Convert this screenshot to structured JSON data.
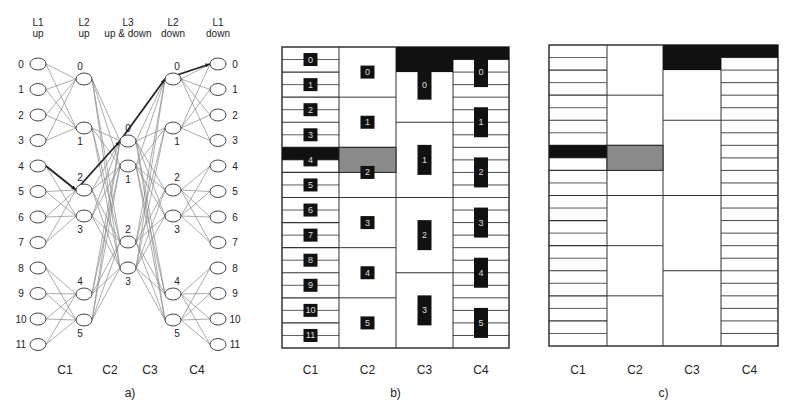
{
  "figure": {
    "panels": [
      {
        "id": "a",
        "caption": "a)"
      },
      {
        "id": "b",
        "caption": "b)"
      },
      {
        "id": "c",
        "caption": "c)"
      }
    ],
    "column_labels": [
      "C1",
      "C2",
      "C3",
      "C4"
    ]
  },
  "panel_a": {
    "caption": "a)",
    "stage_headers": [
      {
        "line1": "L1",
        "line2": "up"
      },
      {
        "line1": "L2",
        "line2": "up"
      },
      {
        "line1": "L3",
        "line2": "up & down"
      },
      {
        "line1": "L2",
        "line2": "down"
      },
      {
        "line1": "L1",
        "line2": "down"
      }
    ],
    "l1_up_nodes": [
      "0",
      "1",
      "2",
      "3",
      "4",
      "5",
      "6",
      "7",
      "8",
      "9",
      "10",
      "11"
    ],
    "l2_up_nodes": [
      "0",
      "1",
      "2",
      "3",
      "4",
      "5"
    ],
    "l3_nodes": [
      "0",
      "1",
      "2",
      "3"
    ],
    "l2_down_nodes": [
      "0",
      "1",
      "2",
      "3",
      "4",
      "5"
    ],
    "l1_down_nodes": [
      "0",
      "1",
      "2",
      "3",
      "4",
      "5",
      "6",
      "7",
      "8",
      "9",
      "10",
      "11"
    ],
    "column_labels": [
      "C1",
      "C2",
      "C3",
      "C4"
    ],
    "highlighted_path": [
      "L1up-4",
      "L2up-2",
      "L3-0",
      "L2down-0",
      "L1down-0"
    ],
    "colors": {
      "edge": "#888888",
      "path": "#222222",
      "node_stroke": "#444444"
    }
  },
  "panel_b": {
    "caption": "b)",
    "column_labels": [
      "C1",
      "C2",
      "C3",
      "C4"
    ],
    "c1_labels": [
      "0",
      "1",
      "2",
      "3",
      "4",
      "5",
      "6",
      "7",
      "8",
      "9",
      "10",
      "11"
    ],
    "c2_labels": [
      "0",
      "1",
      "2",
      "3",
      "4",
      "5"
    ],
    "c3_labels": [
      "0",
      "1",
      "2",
      "3"
    ],
    "c4_labels": [
      "0",
      "1",
      "2",
      "3",
      "4",
      "5"
    ],
    "highlighted_c1_row": "4",
    "highlighted_c2_cell": "2",
    "colors": {
      "black": "#111111",
      "grey": "#8a8a8a",
      "grid": "#333333"
    }
  },
  "panel_c": {
    "caption": "c)",
    "column_labels": [
      "C1",
      "C2",
      "C3",
      "C4"
    ],
    "colors": {
      "black": "#111111",
      "grey": "#8a8a8a",
      "grid": "#333333"
    }
  }
}
